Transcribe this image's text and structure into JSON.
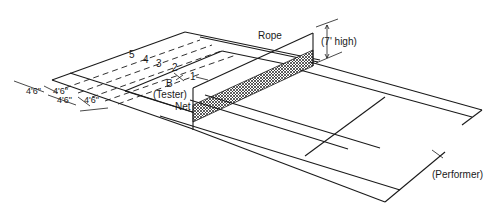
{
  "diagram": {
    "labels": {
      "rope": "Rope",
      "height": "(7' high)",
      "tester_letter": "B",
      "tester": "(Tester)",
      "net": "Net",
      "performer": "(Performer)"
    },
    "zones": [
      "1",
      "2",
      "3",
      "4",
      "5"
    ],
    "dimensions": [
      "4'6\"",
      "4'6\"",
      "4'6\"",
      "4'6\""
    ]
  }
}
